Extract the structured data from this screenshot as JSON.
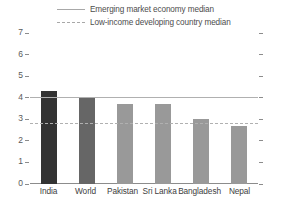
{
  "chart_data": {
    "type": "bar",
    "title": "",
    "xlabel": "",
    "ylabel": "",
    "ylim": [
      0,
      7
    ],
    "yticks": [
      "0",
      "1",
      "2",
      "3",
      "4",
      "5",
      "6",
      "7"
    ],
    "grid": false,
    "legend_position": "top",
    "categories": [
      "India",
      "World",
      "Pakistan",
      "Sri Lanka",
      "Bangladesh",
      "Nepal"
    ],
    "values": [
      4.3,
      4.0,
      3.7,
      3.7,
      3.0,
      2.7
    ],
    "bar_colors": [
      "#333333",
      "#666666",
      "#999999",
      "#999999",
      "#999999",
      "#999999"
    ],
    "series": [
      {
        "name": "Value",
        "values": [
          4.3,
          4.0,
          3.7,
          3.7,
          3.0,
          2.7
        ]
      }
    ],
    "reference_lines": [
      {
        "label": "Emerging market economy median",
        "value": 4.0,
        "style": "solid",
        "color": "#b0b0b0"
      },
      {
        "label": "Low-income developing country median",
        "value": 2.8,
        "style": "dashed",
        "color": "#b0b0b0"
      }
    ]
  },
  "legend": {
    "items": [
      {
        "label": "Emerging market economy median",
        "style": "solid"
      },
      {
        "label": "Low-income developing country median",
        "style": "dashed"
      }
    ]
  },
  "axis": {
    "y_tick_labels": [
      "7",
      "6",
      "5",
      "4",
      "3",
      "2",
      "1",
      "0"
    ]
  }
}
